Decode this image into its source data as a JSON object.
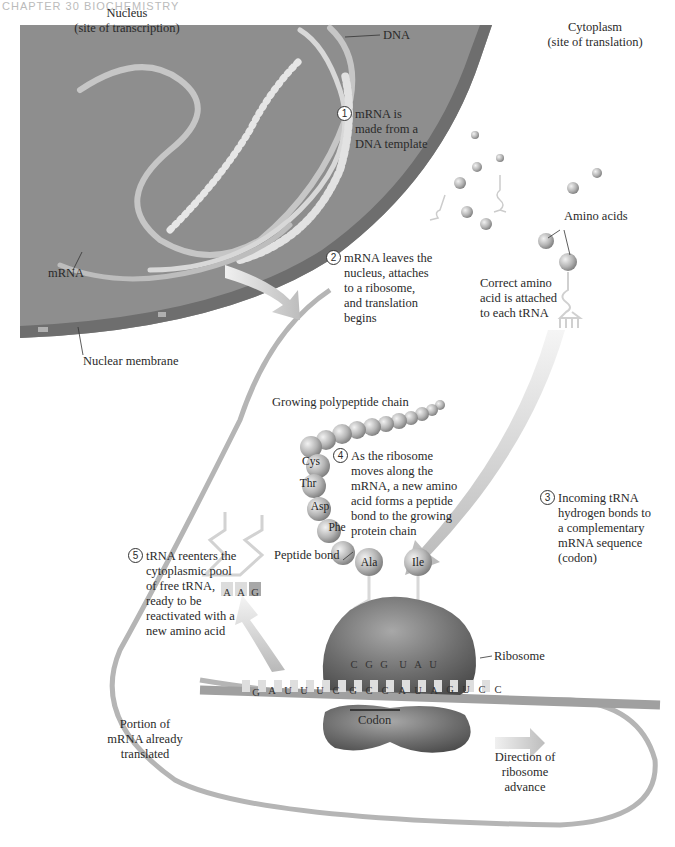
{
  "header": {
    "running_head": "CHAPTER 30  BIOCHEMISTRY"
  },
  "regions": {
    "nucleus": {
      "title": "Nucleus",
      "subtitle": "(site of transcription)"
    },
    "cytoplasm": {
      "title": "Cytoplasm",
      "subtitle": "(site of translation)"
    }
  },
  "labels": {
    "dna": "DNA",
    "mrna": "mRNA",
    "nuclear_membrane": "Nuclear membrane",
    "amino_acids": "Amino acids",
    "correct_amino_acid": [
      "Correct amino",
      "acid is attached",
      "to each tRNA"
    ],
    "growing_chain": "Growing polypeptide chain",
    "peptide_bond": "Peptide bond",
    "ribosome": "Ribosome",
    "codon": "Codon",
    "portion_translated": [
      "Portion of",
      "mRNA already",
      "translated"
    ],
    "direction": [
      "Direction of",
      "ribosome",
      "advance"
    ]
  },
  "steps": [
    {
      "num": "1",
      "lines": [
        "mRNA is",
        "made from a",
        "DNA template"
      ]
    },
    {
      "num": "2",
      "lines": [
        "mRNA leaves the",
        "nucleus, attaches",
        "to a ribosome,",
        "and translation",
        "begins"
      ]
    },
    {
      "num": "3",
      "lines": [
        "Incoming tRNA",
        "hydrogen bonds to",
        "a complementary",
        "mRNA sequence",
        "(codon)"
      ]
    },
    {
      "num": "4",
      "lines": [
        "As the ribosome",
        "moves along the",
        "mRNA, a new amino",
        "acid forms a peptide",
        "bond to the growing",
        "protein chain"
      ]
    },
    {
      "num": "5",
      "lines": [
        "tRNA reenters the",
        "cytoplasmic pool",
        "of free tRNA,",
        "ready to be",
        "reactivated with a",
        "new amino acid"
      ]
    }
  ],
  "amino_acid_chain": [
    "Cys",
    "Thr",
    "Asp",
    "Phe",
    "Ala"
  ],
  "incoming_amino_acid": "Ile",
  "anticodons": {
    "leaving_trna": [
      "A",
      "A",
      "G"
    ],
    "ribosome_trnas": [
      "C",
      "G",
      "G",
      "U",
      "A",
      "U"
    ]
  },
  "mrna_sequence": [
    "G",
    "A",
    "U",
    "U",
    "U",
    "C",
    "G",
    "C",
    "C",
    "A",
    "U",
    "A",
    "G",
    "U",
    "C",
    "C"
  ],
  "colors": {
    "nucleus_fill": "#8e8e8e",
    "membrane": "#6e6e6e",
    "mrna_strand": "#b5b5b5",
    "ribosome": "#7a7a7a",
    "amino_acid": "#b8b8b8",
    "arrow": "#c4c4c4"
  }
}
